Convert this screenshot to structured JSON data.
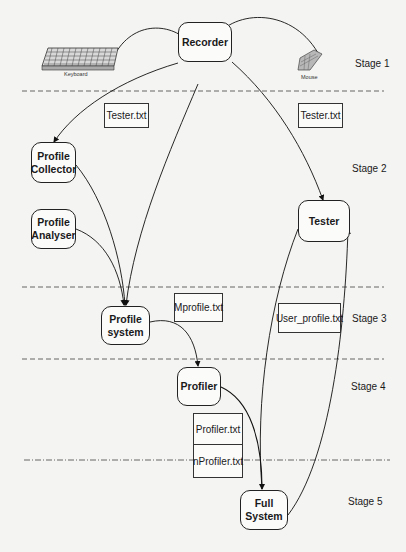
{
  "diagram": {
    "type": "staged-flow-diagram",
    "stages": [
      {
        "id": "stage1",
        "label": "Stage 1"
      },
      {
        "id": "stage2",
        "label": "Stage 2"
      },
      {
        "id": "stage3",
        "label": "Stage 3"
      },
      {
        "id": "stage4",
        "label": "Stage 4"
      },
      {
        "id": "stage5",
        "label": "Stage 5"
      }
    ],
    "devices": {
      "keyboard": {
        "label": "Keyboard",
        "icon": "keyboard-icon"
      },
      "mouse": {
        "label": "Mouse",
        "icon": "mouse-icon"
      }
    },
    "nodes": {
      "recorder": {
        "line1": "Recorder",
        "line2": ""
      },
      "profile_collector": {
        "line1": "Profile",
        "line2": "Collector"
      },
      "profile_analyser": {
        "line1": "Profile",
        "line2": "Analyser"
      },
      "tester": {
        "line1": "Tester",
        "line2": ""
      },
      "profile_system": {
        "line1": "Profile",
        "line2": "system"
      },
      "profiler": {
        "line1": "Profiler",
        "line2": ""
      },
      "full_system": {
        "line1": "Full",
        "line2": "System"
      }
    },
    "files": {
      "tester_txt_left": "Tester.txt",
      "tester_txt_right": "Tester.txt",
      "mprofile_txt": "Mprofile.txt",
      "user_profile_txt": "User_profile.txt",
      "profiler_txt": "Profiler.txt",
      "nprofiler_txt": "nProfiler.txt"
    },
    "edges": [
      {
        "from": "Keyboard",
        "to": "Recorder"
      },
      {
        "from": "Mouse",
        "to": "Recorder"
      },
      {
        "from": "Recorder",
        "to": "Profile Collector"
      },
      {
        "from": "Recorder",
        "to": "Profile system"
      },
      {
        "from": "Recorder",
        "to": "Tester"
      },
      {
        "from": "Profile Collector",
        "to": "Profile system"
      },
      {
        "from": "Profile Analyser",
        "to": "Profile system"
      },
      {
        "from": "Profile system",
        "to": "Profiler"
      },
      {
        "from": "Profiler",
        "to": "Full System"
      },
      {
        "from": "Tester",
        "to": "Full System"
      },
      {
        "from": "Full System",
        "to": "Tester"
      }
    ]
  }
}
